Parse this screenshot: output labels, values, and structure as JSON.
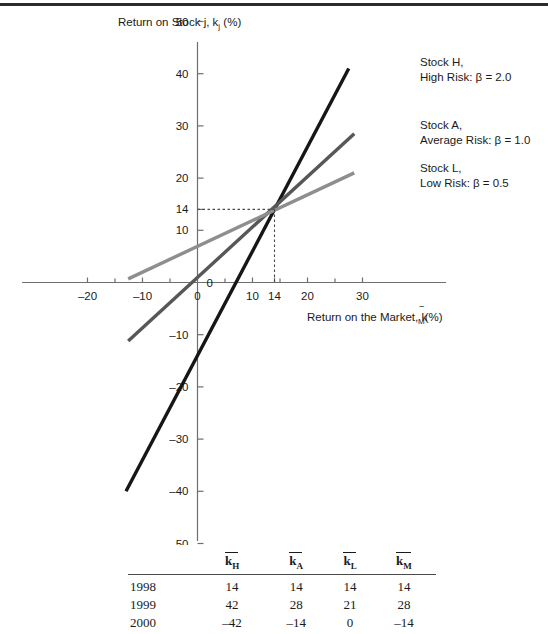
{
  "chart_data": {
    "type": "line",
    "title": "",
    "ylabel": "Return on Stock j, k",
    "ylabel_sub": "j",
    "ylabel_tail": " (%)",
    "xlabel_lead": "Return on the Market, k",
    "xlabel_sub": "M",
    "xlabel_tail": "(%)",
    "xlim": [
      -22,
      32
    ],
    "ylim": [
      -52,
      52
    ],
    "grid": false,
    "x_ticks_major": [
      -20,
      -10,
      0,
      10,
      14,
      20,
      30
    ],
    "x_ticks_major_labels": [
      "–20",
      "–10",
      "0",
      "10",
      "14",
      "20",
      "30"
    ],
    "x_ticks_minor": [
      -15,
      -5,
      5,
      15,
      25
    ],
    "y_ticks_major": [
      50,
      40,
      30,
      20,
      14,
      10,
      0,
      -10,
      -20,
      -30,
      -40,
      -50
    ],
    "y_ticks_major_labels": [
      "50",
      "40",
      "30",
      "20",
      "14",
      "10",
      "0",
      "–10",
      "–20",
      "–30",
      "–40",
      "–50"
    ],
    "intersection": {
      "x": 14,
      "y": 14,
      "label_x": "14",
      "label_y": "14"
    },
    "series": [
      {
        "name": "Stock H, High Risk",
        "beta": 2.0,
        "color": "#161616",
        "width": 3.4,
        "x_start": -13.0,
        "x_end": 27.5,
        "y_start": -40.0,
        "y_end": 41.0
      },
      {
        "name": "Stock A, Average Risk",
        "beta": 1.0,
        "color": "#575757",
        "width": 3.4,
        "x_start": -12.6,
        "x_end": 28.5,
        "y_start": -11.2,
        "y_end": 28.5
      },
      {
        "name": "Stock L, Low Risk",
        "beta": 0.5,
        "color": "#8e8e8e",
        "width": 3.4,
        "x_start": -12.6,
        "x_end": 28.5,
        "y_start": 0.7,
        "y_end": 21.0
      }
    ],
    "annotations": [
      {
        "line1": "Stock H,",
        "line2": "High Risk: β = 2.0",
        "x": 420,
        "y": 66
      },
      {
        "line1": "Stock A,",
        "line2": "Average Risk: β = 1.0",
        "x": 420,
        "y": 129
      },
      {
        "line1": "Stock L,",
        "line2": "Low Risk: β = 0.5",
        "x": 420,
        "y": 172
      }
    ],
    "table": {
      "columns": [
        "",
        "k_H",
        "k_A",
        "k_L",
        "k_M"
      ],
      "column_subscripts": [
        "",
        "H",
        "A",
        "L",
        "M"
      ],
      "rows": [
        {
          "year": "1998",
          "kH": "14",
          "kA": "14",
          "kL": "14",
          "kM": "14"
        },
        {
          "year": "1999",
          "kH": "42",
          "kA": "28",
          "kL": "21",
          "kM": "28"
        },
        {
          "year": "2000",
          "kH": "–42",
          "kA": "–14",
          "kL": "0",
          "kM": "–14"
        }
      ]
    }
  }
}
